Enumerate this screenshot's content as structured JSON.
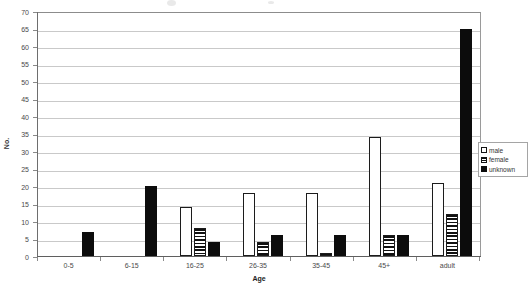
{
  "chart_data": {
    "type": "bar",
    "title": "",
    "xlabel": "Age",
    "ylabel": "No.",
    "categories": [
      "0-5",
      "6-15",
      "16-25",
      "26-35",
      "35-45",
      "45+",
      "adult"
    ],
    "series": [
      {
        "name": "male",
        "values": [
          0,
          0,
          14,
          18,
          18,
          34,
          21
        ]
      },
      {
        "name": "female",
        "values": [
          0,
          0,
          8,
          4,
          1,
          6,
          12
        ]
      },
      {
        "name": "unknown",
        "values": [
          7,
          20,
          4,
          6,
          6,
          6,
          65
        ]
      }
    ],
    "ylim": [
      0,
      70
    ],
    "ytick_step": 5,
    "yticks": [
      0,
      5,
      10,
      15,
      20,
      25,
      30,
      35,
      40,
      45,
      50,
      55,
      60,
      65,
      70
    ],
    "grid": "horizontal",
    "legend_position": "right",
    "colors": {
      "male": "#ffffff",
      "female": "#ffffff",
      "unknown": "#0c0c0c",
      "outline": "#141414",
      "gridline": "#c9c9c9",
      "axis": "#6e6e6e",
      "text": "#3a3a3a"
    }
  },
  "legend": {
    "items": [
      {
        "label": "male",
        "swatch": "male-swatch-icon"
      },
      {
        "label": "female",
        "swatch": "female-swatch-icon"
      },
      {
        "label": "unknown",
        "swatch": "unknown-swatch-icon"
      }
    ]
  }
}
